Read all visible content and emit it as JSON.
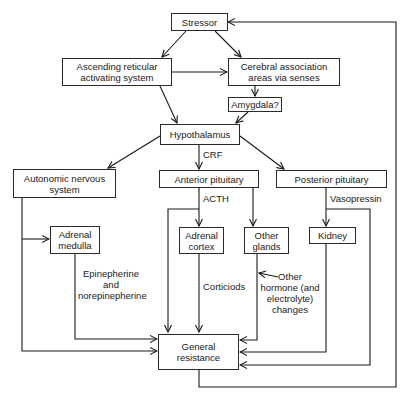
{
  "diagram": {
    "type": "flowchart",
    "nodes": {
      "stressor": "Stressor",
      "ascending": "Ascending reticular activating system",
      "cerebral": "Cerebral association areas via senses",
      "amygdala": "Amygdala?",
      "hypothalamus": "Hypothalamus",
      "autonomic": "Autonomic nervous system",
      "anterior": "Anterior pituitary",
      "posterior": "Posterior pituitary",
      "adrenal_medulla": "Adrenal medulla",
      "adrenal_cortex": "Adrenal cortex",
      "other_glands": "Other glands",
      "kidney": "Kidney",
      "general_resistance": "General resistance"
    },
    "edge_labels": {
      "crf": "CRF",
      "acth": "ACTH",
      "vasopressin": "Vasopressin",
      "epinephrine": "Epinepherine and norepinepherine",
      "corticoids": "Corticiods",
      "other_hormone": "Other hormone (and electrolyte) changes"
    },
    "edges": [
      [
        "stressor",
        "ascending"
      ],
      [
        "stressor",
        "cerebral"
      ],
      [
        "ascending",
        "cerebral"
      ],
      [
        "ascending",
        "hypothalamus"
      ],
      [
        "cerebral",
        "amygdala"
      ],
      [
        "amygdala",
        "hypothalamus"
      ],
      [
        "hypothalamus",
        "autonomic"
      ],
      [
        "hypothalamus",
        "anterior",
        "CRF"
      ],
      [
        "hypothalamus",
        "posterior"
      ],
      [
        "autonomic",
        "adrenal_medulla"
      ],
      [
        "autonomic",
        "general_resistance"
      ],
      [
        "anterior",
        "adrenal_cortex",
        "ACTH"
      ],
      [
        "anterior",
        "general_resistance",
        "ACTH"
      ],
      [
        "anterior",
        "other_glands"
      ],
      [
        "posterior",
        "kidney",
        "Vasopressin"
      ],
      [
        "posterior",
        "general_resistance",
        "Vasopressin"
      ],
      [
        "adrenal_medulla",
        "general_resistance",
        "Epinepherine and norepinepherine"
      ],
      [
        "adrenal_cortex",
        "general_resistance",
        "Corticiods"
      ],
      [
        "other_glands",
        "general_resistance",
        "Other hormone (and electrolyte) changes"
      ],
      [
        "kidney",
        "general_resistance"
      ],
      [
        "general_resistance",
        "stressor"
      ]
    ]
  }
}
